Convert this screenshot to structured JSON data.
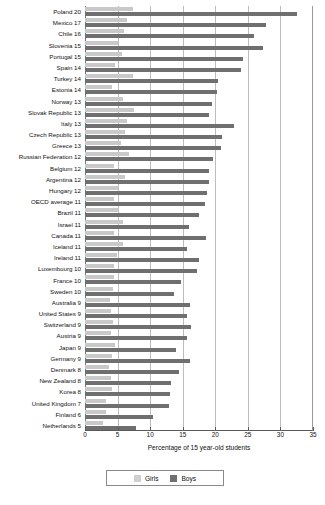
{
  "chart_data": {
    "type": "bar",
    "orientation": "horizontal",
    "title": "",
    "xlabel": "Percentage of 15 year-old students",
    "ylabel": "",
    "xlim": [
      0,
      35
    ],
    "xticks": [
      0,
      5,
      10,
      15,
      20,
      25,
      30,
      35
    ],
    "grid": true,
    "legend_position": "bottom",
    "colors": {
      "girls": "#cfcfcf",
      "boys": "#6f6f6f"
    },
    "categories": [
      "Poland 20",
      "Mexico 17",
      "Chile 16",
      "Slovenia 15",
      "Portugal 15",
      "Spain 14",
      "Turkey 14",
      "Estonia 14",
      "Norway 13",
      "Slovak Republic 13",
      "Italy 13",
      "Czech Republic 13",
      "Greece 13",
      "Russian Federation 12",
      "Belgium 12",
      "Argentina 12",
      "Hungary 12",
      "OECD average 11",
      "Brazil 11",
      "Israel 11",
      "Canada 11",
      "Iceland 11",
      "Ireland 11",
      "Luxembourg 10",
      "France 10",
      "Sweden 10",
      "Australia 9",
      "United States 9",
      "Switzerland 9",
      "Austria 9",
      "Japan 9",
      "Germany 9",
      "Denmark 8",
      "New Zealand 8",
      "Korea 8",
      "United Kingdom 7",
      "Finland 6",
      "Netherlands 5"
    ],
    "series": [
      {
        "name": "Girls",
        "values": [
          7.3,
          6.4,
          6.0,
          5.0,
          5.7,
          4.6,
          7.3,
          4.2,
          5.9,
          7.5,
          6.4,
          6.1,
          5.6,
          6.7,
          4.4,
          6.2,
          5.1,
          4.5,
          5.2,
          5.9,
          4.4,
          5.9,
          4.9,
          4.5,
          4.5,
          4.3,
          3.9,
          4.0,
          4.3,
          4.0,
          4.6,
          4.1,
          3.7,
          4.0,
          4.2,
          3.3,
          3.2,
          2.7
        ]
      },
      {
        "name": "Boys",
        "values": [
          32.6,
          27.8,
          26.0,
          27.3,
          24.2,
          24.0,
          20.4,
          20.3,
          19.5,
          19.0,
          22.9,
          21.1,
          20.9,
          19.7,
          19.1,
          19.0,
          18.7,
          18.4,
          17.5,
          16.0,
          18.6,
          15.6,
          17.5,
          17.2,
          14.8,
          13.6,
          16.1,
          15.6,
          16.3,
          15.6,
          14.0,
          16.1,
          14.5,
          13.2,
          13.0,
          12.9,
          10.4,
          7.9
        ]
      }
    ]
  },
  "legend": {
    "items": [
      {
        "label": "Girls",
        "key": "girls"
      },
      {
        "label": "Boys",
        "key": "boys"
      }
    ]
  }
}
